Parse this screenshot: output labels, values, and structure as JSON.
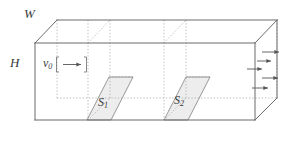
{
  "figure": {
    "kind": "3d-duct-flow-diagram",
    "background_color": "#ffffff",
    "line_color": "#555555",
    "dashed_color": "#9a9a9a",
    "shade_color": "#ececec",
    "text_color": "#3a3a3a"
  },
  "labels": {
    "width_label": "W",
    "height_label": "H",
    "inlet_velocity_symbol": "v",
    "inlet_velocity_subscript": "0",
    "section_1_symbol": "S",
    "section_1_subscript": "1",
    "section_2_symbol": "S",
    "section_2_subscript": "2"
  },
  "icons": {
    "inlet_arrow": "right-arrow-icon",
    "outlet_arrow": "right-arrow-icon"
  },
  "arrows": {
    "inlet_count": 1,
    "outlet_count": 5
  }
}
